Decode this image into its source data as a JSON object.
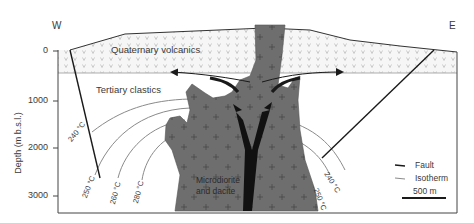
{
  "orientation": {
    "west": "W",
    "east": "E"
  },
  "y_axis": {
    "label": "Depth (m b.s.l.)",
    "ticks": [
      "0",
      "1000",
      "2000",
      "3000"
    ]
  },
  "units": {
    "quaternary": "Quaternary volcanics",
    "tertiary": "Tertiary clastics",
    "intrusion_line1": "Microdiorite",
    "intrusion_line2": "and dacite"
  },
  "isotherms_west": [
    "240 °C",
    "250 °C",
    "260 °C",
    "280 °C"
  ],
  "isotherms_east": [
    "240 °C",
    "250 °C"
  ],
  "legend": {
    "fault": "Fault",
    "isotherm": "Isotherm",
    "scale": "500 m"
  },
  "colors": {
    "intrusion": "#6e6e6e",
    "fault": "#1a1a1a",
    "isotherm": "#8a8a8a",
    "volcanics_fill": "#f4f4f4",
    "frame": "#444444"
  }
}
